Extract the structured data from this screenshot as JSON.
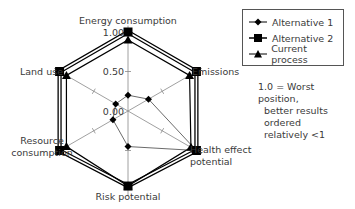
{
  "chart_data": {
    "type": "radar",
    "title": "",
    "axes": [
      "Energy consumption",
      "Emissions",
      "Health effect potential",
      "Risk potential",
      "Resource consumption",
      "Land use"
    ],
    "axis_label_lines": {
      "energy": [
        "Energy consumption"
      ],
      "emissions": [
        "Emissions"
      ],
      "health": [
        "Health effect",
        "potential"
      ],
      "risk": [
        "Risk potential"
      ],
      "resource": [
        "Resource",
        "consumption"
      ],
      "land": [
        "Land use"
      ]
    },
    "tick_labels": [
      "0.00",
      "0.50",
      "1.00"
    ],
    "range": [
      0,
      1
    ],
    "series": [
      {
        "name": "Alternative 1",
        "marker": "diamond",
        "values": [
          0.2,
          0.3,
          1.0,
          0.45,
          0.22,
          0.18
        ]
      },
      {
        "name": "Alternative 2",
        "marker": "square",
        "values": [
          1.0,
          1.0,
          1.0,
          0.95,
          1.0,
          1.0
        ]
      },
      {
        "name": "Current process",
        "marker": "triangle",
        "values": [
          0.9,
          0.9,
          0.92,
          0.95,
          0.9,
          0.9
        ]
      }
    ],
    "legend_position": "top-right",
    "annotation": "1.0 = Worst position, better results ordered relatively <1"
  },
  "legend": {
    "items": [
      "Alternative 1",
      "Alternative 2",
      "Current process"
    ]
  },
  "note": {
    "lines": [
      "1.0 = Worst position,",
      "better results ordered",
      "relatively <1"
    ]
  }
}
